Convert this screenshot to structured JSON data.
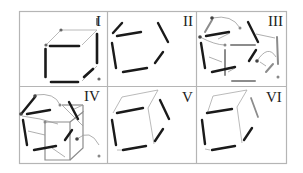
{
  "figure": {
    "panels": [
      {
        "id": "I",
        "label": "I",
        "content": "Complete wireframe cube with bold visible edges and thin hidden-side edges, endpoint markers"
      },
      {
        "id": "II",
        "label": "II",
        "content": "Six disconnected bold line fragments"
      },
      {
        "id": "III",
        "label": "III",
        "content": "Bold fragments with grey candidate segments, nodes and arrows indicating grouping"
      },
      {
        "id": "IV",
        "label": "IV",
        "content": "Fragments with grey cube outline and connecting arrows"
      },
      {
        "id": "V",
        "label": "V",
        "content": "Tilted cube outline with bold front-face edges"
      },
      {
        "id": "VI",
        "label": "VI",
        "content": "Tilted cube outline with bold front-face edges, one grey extra segment"
      }
    ]
  },
  "colors": {
    "border": "#b5b5b5",
    "bold_edge": "#1a1a1a",
    "thin_edge": "#9a9a9a",
    "grey_segment": "#8c8c8c",
    "node": "#555555"
  }
}
